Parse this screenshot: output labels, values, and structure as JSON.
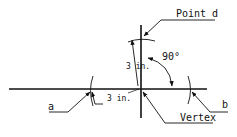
{
  "diagram": {
    "labels": {
      "point_d": "Point d",
      "vertex": "Vertex",
      "a": "a",
      "b": "b",
      "angle": "90°",
      "dim_vertical": "3 in.",
      "dim_horizontal": "3 in."
    },
    "colors": {
      "line": "#111111",
      "background": "#ffffff"
    }
  }
}
